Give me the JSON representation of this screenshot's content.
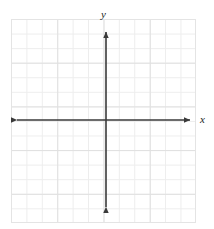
{
  "figure": {
    "kind": "blank-cartesian-coordinate-grid",
    "width": 214,
    "height": 229,
    "background_color": "#ffffff"
  },
  "grid": {
    "left": 11,
    "top": 19,
    "width": 185,
    "height": 204,
    "columns": 12,
    "rows": 14,
    "minor_cell_width": 15.4167,
    "minor_cell_height": 14.5714,
    "major_every": 3,
    "minor_color": "#ededed",
    "major_color": "#e0e0e0",
    "border_color": "#e4e4e4"
  },
  "axes": {
    "color": "#3a3a3a",
    "line_width": 1.6,
    "origin": {
      "x": 106,
      "y": 120
    },
    "x_axis": {
      "label": "x",
      "start_x": 11,
      "end_x": 196,
      "y": 120,
      "arrow_start": true,
      "arrow_end": true
    },
    "y_axis": {
      "label": "y",
      "x": 106,
      "start_y": 213,
      "end_y": 26,
      "arrow_start": true,
      "arrow_end": true
    }
  },
  "labels": {
    "x_label": "x",
    "y_label": "y",
    "font_style": "italic",
    "color": "#1d1d1d"
  },
  "chart_data": {
    "type": "scatter",
    "title": "",
    "subtitle": "",
    "xlabel": "x",
    "ylabel": "y",
    "series": [
      {
        "name": "",
        "x": [],
        "y": []
      }
    ],
    "x": [],
    "categories": [],
    "values": [],
    "xlim": [
      -6,
      6
    ],
    "ylim": [
      -7,
      7
    ],
    "xticks": [],
    "yticks": [],
    "xticklabels": [],
    "yticklabels": [],
    "grid": true,
    "legend": false,
    "legend_position": "none",
    "annotations": [],
    "note": "Empty coordinate plane: grid and labeled axes only, no plotted data points, curves, or tick numbers."
  }
}
